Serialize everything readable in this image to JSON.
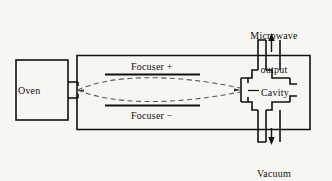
{
  "diagram": {
    "background_color": "#f7f6f2",
    "line_color": "#111111",
    "beam_color": "#555555",
    "components": {
      "oven": {
        "label": "Oven"
      },
      "cavity": {
        "label": "Cavity"
      },
      "focuser_upper": {
        "label": "Focuser +"
      },
      "focuser_lower": {
        "label": "Focuser −"
      },
      "microwave_output": {
        "label_line1": "Microwave",
        "label_line2": "output",
        "arrow": "up-arrow"
      },
      "vacuum_pump": {
        "label_line1": "Vacuum",
        "label_line2": "pump",
        "arrow": "down-arrow"
      }
    }
  }
}
